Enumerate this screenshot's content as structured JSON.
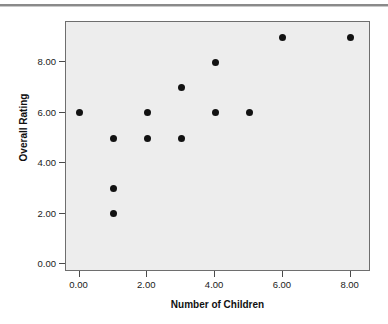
{
  "chart_data": {
    "type": "scatter",
    "title": "",
    "xlabel": "Number of Children",
    "ylabel": "Overall Rating",
    "xlim": [
      -0.4,
      8.6
    ],
    "ylim": [
      -0.3,
      9.6
    ],
    "xticks": [
      0,
      2,
      4,
      6,
      8
    ],
    "xtick_labels": [
      "0.00",
      "2.00",
      "4.00",
      "6.00",
      "8.00"
    ],
    "yticks": [
      0,
      2,
      4,
      6,
      8
    ],
    "ytick_labels": [
      "0.00",
      "2.00",
      "4.00",
      "6.00",
      "8.00"
    ],
    "grid": false,
    "legend": null,
    "marker": {
      "shape": "circle",
      "color": "#121212",
      "size_px": 7
    },
    "plot_background": "#ededed",
    "page_background": "#ffffff",
    "border_color": "#6e6e6e",
    "points": [
      {
        "x": 0,
        "y": 6
      },
      {
        "x": 1,
        "y": 5
      },
      {
        "x": 1,
        "y": 3
      },
      {
        "x": 1,
        "y": 2
      },
      {
        "x": 2,
        "y": 6
      },
      {
        "x": 2,
        "y": 5
      },
      {
        "x": 3,
        "y": 7
      },
      {
        "x": 3,
        "y": 5
      },
      {
        "x": 4,
        "y": 8
      },
      {
        "x": 4,
        "y": 6
      },
      {
        "x": 5,
        "y": 6
      },
      {
        "x": 6,
        "y": 9
      },
      {
        "x": 8,
        "y": 9
      }
    ]
  }
}
